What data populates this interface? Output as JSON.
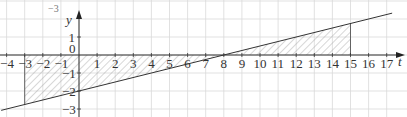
{
  "chart_data": {
    "type": "line",
    "title": "",
    "xlabel": "t",
    "ylabel": "y",
    "xlim": [
      -4.3,
      17.5
    ],
    "ylim": [
      -3.2,
      2.5
    ],
    "grid": true,
    "x_ticks": [
      -4,
      -3,
      -2,
      -1,
      0,
      1,
      2,
      3,
      4,
      5,
      6,
      7,
      8,
      9,
      10,
      11,
      12,
      13,
      14,
      15,
      16,
      17
    ],
    "y_ticks": [
      1,
      -1,
      -2,
      -3
    ],
    "series": [
      {
        "name": "y = t/4 - 2",
        "x": [
          -4.3,
          17.3
        ],
        "values": [
          -3.075,
          2.325
        ],
        "slope": 0.25,
        "intercept": -2
      }
    ],
    "shaded_regions": [
      {
        "from": -3,
        "to": 8,
        "between": [
          "line",
          "t-axis"
        ],
        "side": "below axis"
      },
      {
        "from": 8,
        "to": 15,
        "between": [
          "line",
          "t-axis"
        ],
        "side": "above axis"
      }
    ],
    "annotations": [
      "-3 (partially cropped text at top-left)"
    ]
  },
  "labels": {
    "x_axis": "t",
    "y_axis": "y",
    "origin": "0",
    "cropped_top": "−3"
  }
}
